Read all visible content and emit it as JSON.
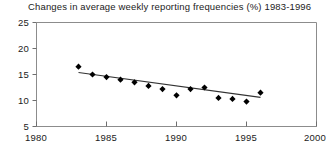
{
  "chart_data": {
    "type": "scatter",
    "title": "Changes in average weekly reporting frequencies (%) 1983-1996",
    "xlabel": "",
    "ylabel": "",
    "xlim": [
      1980,
      2000
    ],
    "ylim": [
      5,
      25
    ],
    "xticks": [
      1980,
      1985,
      1990,
      1995,
      2000
    ],
    "yticks": [
      5,
      10,
      15,
      20,
      25
    ],
    "xtick_labels": [
      "1980",
      "1985",
      "1990",
      "1995",
      "2000"
    ],
    "ytick_labels": [
      "5",
      "10",
      "15",
      "20",
      "25"
    ],
    "grid": false,
    "legend": false,
    "marker": "diamond",
    "marker_color": "#000000",
    "line_color": "#333333",
    "axis_color": "#808080",
    "x": [
      1983,
      1984,
      1985,
      1986,
      1987,
      1988,
      1989,
      1990,
      1991,
      1992,
      1993,
      1994,
      1995,
      1996
    ],
    "values": [
      16.5,
      15.0,
      14.5,
      14.0,
      13.5,
      12.8,
      12.2,
      11.0,
      12.2,
      12.5,
      10.5,
      10.3,
      9.8,
      11.5
    ],
    "series": [
      {
        "name": "Average weekly reporting frequency",
        "values": [
          16.5,
          15.0,
          14.5,
          14.0,
          13.5,
          12.8,
          12.2,
          11.0,
          12.2,
          12.5,
          10.5,
          10.3,
          9.8,
          11.5
        ]
      }
    ],
    "trendline": {
      "type": "linear",
      "x_start": 1983,
      "y_start": 15.4,
      "x_end": 1996,
      "y_end": 10.6
    }
  }
}
